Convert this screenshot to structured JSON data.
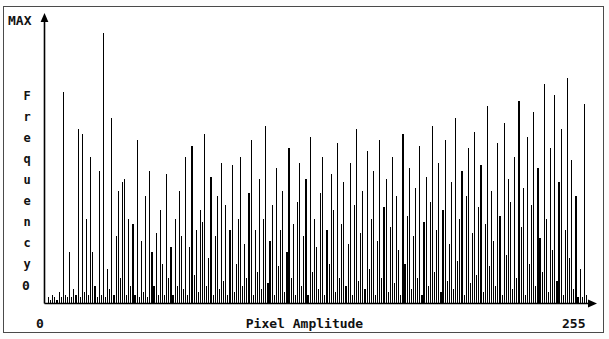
{
  "figure": {
    "kind": "histogram-figure",
    "background_color": "#ffffff",
    "ink_color": "#000000",
    "border_color": "#4a4a4a"
  },
  "axis": {
    "y_top_label": "MAX",
    "y_bottom_label": "0",
    "y_title_letters": [
      "F",
      "r",
      "e",
      "q",
      "u",
      "e",
      "n",
      "c",
      "y"
    ],
    "x_title": "Pixel Amplitude",
    "x_min_label": "0",
    "x_max_label": "255",
    "y_arrow_icon": "arrow-up-icon",
    "x_arrow_icon": "arrow-right-icon"
  },
  "chart_data": {
    "type": "bar",
    "title": "",
    "xlabel": "Pixel Amplitude",
    "ylabel": "Frequency",
    "xlim": [
      0,
      255
    ],
    "ylim": [
      0,
      100
    ],
    "ytick_labels": [
      "0",
      "MAX"
    ],
    "xtick_labels": [
      "0",
      "255"
    ],
    "grid": false,
    "legend": false,
    "note": "Values are percent of MAX frequency, one bin per pixel amplitude 0-255.",
    "categories": [
      0,
      1,
      2,
      3,
      4,
      5,
      6,
      7,
      8,
      9,
      10,
      11,
      12,
      13,
      14,
      15,
      16,
      17,
      18,
      19,
      20,
      21,
      22,
      23,
      24,
      25,
      26,
      27,
      28,
      29,
      30,
      31,
      32,
      33,
      34,
      35,
      36,
      37,
      38,
      39,
      40,
      41,
      42,
      43,
      44,
      45,
      46,
      47,
      48,
      49,
      50,
      51,
      52,
      53,
      54,
      55,
      56,
      57,
      58,
      59,
      60,
      61,
      62,
      63,
      64,
      65,
      66,
      67,
      68,
      69,
      70,
      71,
      72,
      73,
      74,
      75,
      76,
      77,
      78,
      79,
      80,
      81,
      82,
      83,
      84,
      85,
      86,
      87,
      88,
      89,
      90,
      91,
      92,
      93,
      94,
      95,
      96,
      97,
      98,
      99,
      100,
      101,
      102,
      103,
      104,
      105,
      106,
      107,
      108,
      109,
      110,
      111,
      112,
      113,
      114,
      115,
      116,
      117,
      118,
      119,
      120,
      121,
      122,
      123,
      124,
      125,
      126,
      127,
      128,
      129,
      130,
      131,
      132,
      133,
      134,
      135,
      136,
      137,
      138,
      139,
      140,
      141,
      142,
      143,
      144,
      145,
      146,
      147,
      148,
      149,
      150,
      151,
      152,
      153,
      154,
      155,
      156,
      157,
      158,
      159,
      160,
      161,
      162,
      163,
      164,
      165,
      166,
      167,
      168,
      169,
      170,
      171,
      172,
      173,
      174,
      175,
      176,
      177,
      178,
      179,
      180,
      181,
      182,
      183,
      184,
      185,
      186,
      187,
      188,
      189,
      190,
      191,
      192,
      193,
      194,
      195,
      196,
      197,
      198,
      199,
      200,
      201,
      202,
      203,
      204,
      205,
      206,
      207,
      208,
      209,
      210,
      211,
      212,
      213,
      214,
      215,
      216,
      217,
      218,
      219,
      220,
      221,
      222,
      223,
      224,
      225,
      226,
      227,
      228,
      229,
      230,
      231,
      232,
      233,
      234,
      235,
      236,
      237,
      238,
      239,
      240,
      241,
      242,
      243,
      244,
      245,
      246,
      247,
      248,
      249,
      250,
      251,
      252,
      253,
      254,
      255
    ],
    "values": [
      2,
      1,
      3,
      2,
      1,
      4,
      2,
      75,
      3,
      2,
      18,
      2,
      5,
      3,
      62,
      2,
      60,
      4,
      30,
      3,
      52,
      18,
      6,
      2,
      47,
      3,
      96,
      2,
      12,
      5,
      66,
      3,
      24,
      40,
      9,
      43,
      44,
      3,
      30,
      6,
      28,
      3,
      58,
      2,
      22,
      4,
      38,
      2,
      47,
      18,
      6,
      25,
      3,
      33,
      14,
      3,
      46,
      9,
      20,
      3,
      30,
      6,
      40,
      24,
      5,
      52,
      3,
      20,
      56,
      10,
      26,
      4,
      33,
      29,
      60,
      6,
      16,
      45,
      3,
      24,
      38,
      5,
      50,
      8,
      35,
      3,
      26,
      49,
      4,
      14,
      30,
      52,
      6,
      21,
      9,
      39,
      58,
      3,
      26,
      11,
      44,
      5,
      30,
      63,
      7,
      22,
      35,
      3,
      48,
      13,
      26,
      40,
      4,
      18,
      55,
      9,
      28,
      3,
      36,
      50,
      6,
      24,
      44,
      3,
      59,
      11,
      30,
      20,
      5,
      39,
      52,
      3,
      26,
      14,
      46,
      33,
      4,
      57,
      9,
      28,
      43,
      6,
      21,
      50,
      3,
      35,
      62,
      8,
      25,
      40,
      5,
      54,
      12,
      30,
      47,
      3,
      22,
      58,
      9,
      34,
      44,
      4,
      27,
      52,
      7,
      38,
      19,
      3,
      60,
      14,
      31,
      48,
      5,
      24,
      41,
      9,
      56,
      3,
      29,
      45,
      6,
      36,
      63,
      11,
      26,
      50,
      4,
      33,
      58,
      8,
      21,
      43,
      5,
      66,
      15,
      30,
      47,
      3,
      38,
      55,
      7,
      25,
      61,
      10,
      34,
      49,
      4,
      28,
      70,
      13,
      40,
      22,
      6,
      57,
      31,
      3,
      64,
      17,
      44,
      36,
      5,
      52,
      9,
      72,
      27,
      41,
      3,
      59,
      14,
      35,
      68,
      6,
      48,
      23,
      11,
      78,
      30,
      4,
      55,
      19,
      74,
      8,
      43,
      62,
      3,
      26,
      80,
      16,
      51,
      5,
      38,
      2,
      12,
      2,
      71,
      3
    ]
  }
}
